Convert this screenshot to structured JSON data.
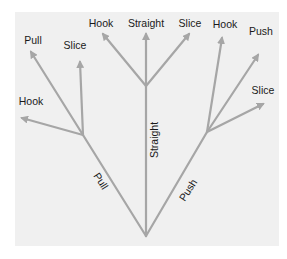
{
  "diagram": {
    "title": "",
    "colors": {
      "background": "#ffffff",
      "panel": "#f0f0f0",
      "line": "#a6a6a6",
      "text": "#1a1a1a"
    },
    "root": {
      "x": 146,
      "y": 236
    },
    "branches": [
      {
        "id": "pull",
        "label": "Pull",
        "node": {
          "x": 83,
          "y": 135
        },
        "label_pos": {
          "x": 101,
          "y": 181,
          "angle": 57
        },
        "children": [
          {
            "label": "Pull",
            "tip": {
              "x": 31,
              "y": 52
            },
            "label_pos": {
              "x": 33,
              "y": 40
            }
          },
          {
            "label": "Slice",
            "tip": {
              "x": 80,
              "y": 62
            },
            "label_pos": {
              "x": 75,
              "y": 45
            }
          },
          {
            "label": "Hook",
            "tip": {
              "x": 22,
              "y": 118
            },
            "label_pos": {
              "x": 31,
              "y": 101
            }
          }
        ]
      },
      {
        "id": "straight",
        "label": "Straight",
        "node": {
          "x": 146,
          "y": 86
        },
        "label_pos": {
          "x": 154,
          "y": 140,
          "angle": -90
        },
        "children": [
          {
            "label": "Hook",
            "tip": {
              "x": 103,
              "y": 34
            },
            "label_pos": {
              "x": 101,
              "y": 23
            }
          },
          {
            "label": "Straight",
            "tip": {
              "x": 146,
              "y": 34
            },
            "label_pos": {
              "x": 146,
              "y": 23
            }
          },
          {
            "label": "Slice",
            "tip": {
              "x": 189,
              "y": 34
            },
            "label_pos": {
              "x": 190,
              "y": 23
            }
          }
        ]
      },
      {
        "id": "push",
        "label": "Push",
        "node": {
          "x": 207,
          "y": 132
        },
        "label_pos": {
          "x": 188,
          "y": 190,
          "angle": -57
        },
        "children": [
          {
            "label": "Hook",
            "tip": {
              "x": 222,
              "y": 38
            },
            "label_pos": {
              "x": 225,
              "y": 24
            }
          },
          {
            "label": "Push",
            "tip": {
              "x": 258,
              "y": 55
            },
            "label_pos": {
              "x": 261,
              "y": 31
            }
          },
          {
            "label": "Slice",
            "tip": {
              "x": 263,
              "y": 104
            },
            "label_pos": {
              "x": 263,
              "y": 90
            }
          }
        ]
      }
    ]
  }
}
